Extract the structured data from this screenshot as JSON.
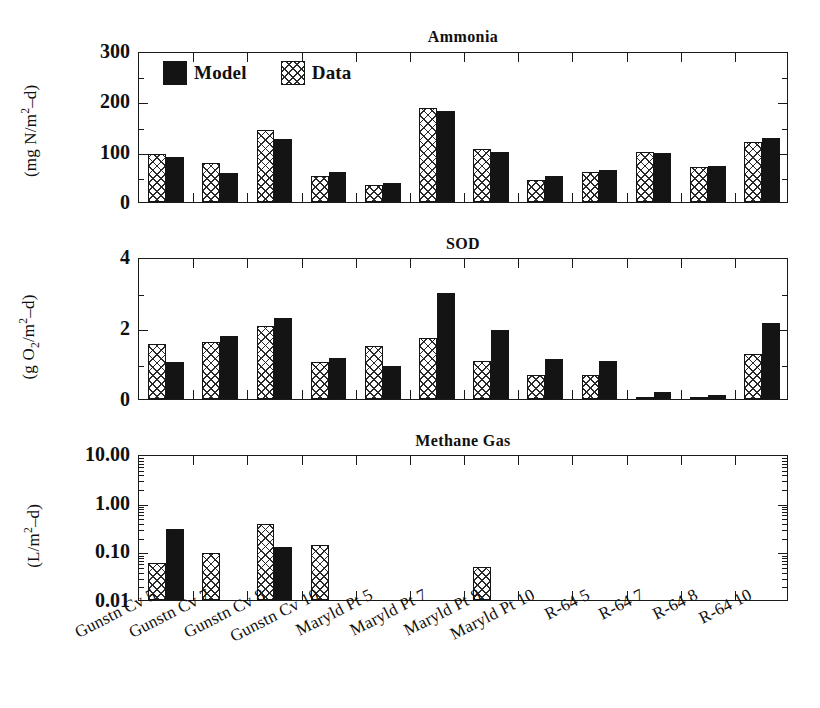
{
  "figure": {
    "width": 820,
    "height": 708,
    "background": "#ffffff",
    "ink_color": "#141414"
  },
  "legend": {
    "position": "top-left of first panel",
    "entries": [
      {
        "label": "Model",
        "swatch": "solid-black",
        "color": "#141414"
      },
      {
        "label": "Data",
        "swatch": "crosshatch",
        "color": "#2a2a2a"
      }
    ]
  },
  "categories": [
    "Gunstn Cv 5",
    "Gunstn Cv 7",
    "Gunstn Cv 8",
    "Gunstn Cv 10",
    "Maryld Pt 5",
    "Maryld Pt 7",
    "Maryld Pt 8",
    "Maryld Pt 10",
    "R-64 5",
    "R-64 7",
    "R-64 8",
    "R-64 10"
  ],
  "chart_data": [
    {
      "type": "bar",
      "title": "Ammonia",
      "ylabel": "(mg N/m2-d)",
      "ylabel_parts": {
        "prefix": "(mg N/m",
        "sup": "2",
        "suffix": "–d)"
      },
      "xlabel": "",
      "ylim": [
        0,
        300
      ],
      "yticks": [
        0,
        100,
        200,
        300
      ],
      "ytick_labels": [
        "0",
        "100",
        "200",
        "300"
      ],
      "yminor_step": 50,
      "scale": "linear",
      "grid": false,
      "categories": [
        "Gunstn Cv 5",
        "Gunstn Cv 7",
        "Gunstn Cv 8",
        "Gunstn Cv 10",
        "Maryld Pt 5",
        "Maryld Pt 7",
        "Maryld Pt 8",
        "Maryld Pt 10",
        "R-64 5",
        "R-64 7",
        "R-64 8",
        "R-64 10"
      ],
      "series": [
        {
          "name": "Data",
          "values": [
            96,
            77,
            143,
            52,
            33,
            186,
            106,
            44,
            59,
            99,
            70,
            119
          ]
        },
        {
          "name": "Model",
          "values": [
            90,
            58,
            125,
            60,
            37,
            181,
            100,
            52,
            64,
            97,
            72,
            127
          ]
        }
      ]
    },
    {
      "type": "bar",
      "title": "SOD",
      "ylabel": "(g O2/m2-d)",
      "ylabel_parts": {
        "prefix": "(g O",
        "sub": "2",
        "mid": "/m",
        "sup": "2",
        "suffix": "–d)"
      },
      "xlabel": "",
      "ylim": [
        0,
        4
      ],
      "yticks": [
        0,
        2,
        4
      ],
      "ytick_labels": [
        "0",
        "2",
        "4"
      ],
      "yminor_step": 1,
      "scale": "linear",
      "grid": false,
      "categories": [
        "Gunstn Cv 5",
        "Gunstn Cv 7",
        "Gunstn Cv 8",
        "Gunstn Cv 10",
        "Maryld Pt 5",
        "Maryld Pt 7",
        "Maryld Pt 8",
        "Maryld Pt 10",
        "R-64 5",
        "R-64 7",
        "R-64 8",
        "R-64 10"
      ],
      "series": [
        {
          "name": "Data",
          "values": [
            1.55,
            1.62,
            2.05,
            1.03,
            1.48,
            1.73,
            1.08,
            0.67,
            0.68,
            0.03,
            0.02,
            1.28
          ]
        },
        {
          "name": "Model",
          "values": [
            1.05,
            1.78,
            2.28,
            1.15,
            0.92,
            2.98,
            1.95,
            1.12,
            1.07,
            0.2,
            0.1,
            2.13
          ]
        }
      ]
    },
    {
      "type": "bar",
      "title": "Methane Gas",
      "ylabel": "(L/m2-d)",
      "ylabel_parts": {
        "prefix": "(L/m",
        "sup": "2",
        "suffix": "–d)"
      },
      "xlabel": "",
      "ylim": [
        0.01,
        10.0
      ],
      "yticks": [
        0.01,
        0.1,
        1.0,
        10.0
      ],
      "ytick_labels": [
        "0.01",
        "0.10",
        "1.00",
        "10.00"
      ],
      "scale": "log",
      "grid": false,
      "categories": [
        "Gunstn Cv 5",
        "Gunstn Cv 7",
        "Gunstn Cv 8",
        "Gunstn Cv 10",
        "Maryld Pt 5",
        "Maryld Pt 7",
        "Maryld Pt 8",
        "Maryld Pt 10",
        "R-64 5",
        "R-64 7",
        "R-64 8",
        "R-64 10"
      ],
      "series": [
        {
          "name": "Data",
          "values": [
            0.058,
            0.091,
            0.37,
            0.135,
            null,
            null,
            0.048,
            null,
            null,
            null,
            null,
            null
          ]
        },
        {
          "name": "Model",
          "values": [
            0.29,
            null,
            0.12,
            null,
            null,
            null,
            null,
            null,
            null,
            null,
            null,
            null
          ]
        }
      ]
    }
  ]
}
